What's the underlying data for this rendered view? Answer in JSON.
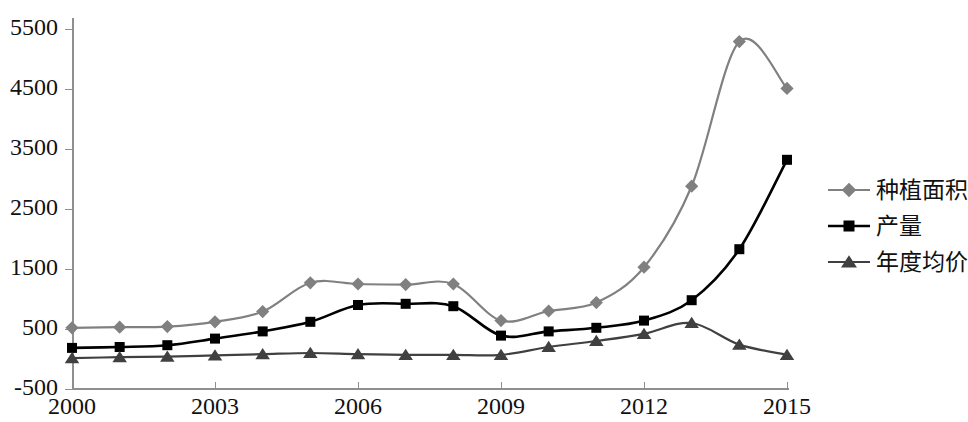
{
  "chart_data": {
    "type": "line",
    "title": "",
    "xlabel": "",
    "ylabel": "",
    "x": [
      2000,
      2001,
      2002,
      2003,
      2004,
      2005,
      2006,
      2007,
      2008,
      2009,
      2010,
      2011,
      2012,
      2013,
      2014,
      2015
    ],
    "xlim": [
      2000,
      2015
    ],
    "ylim": [
      -500,
      6000
    ],
    "yticks": [
      -500,
      500,
      1500,
      2500,
      3500,
      4500,
      5500
    ],
    "ytick_labels": [
      "-500",
      "500",
      "1500",
      "2500",
      "3500",
      "4500",
      "5500"
    ],
    "xticks": [
      2000,
      2003,
      2006,
      2009,
      2012,
      2015
    ],
    "xtick_labels": [
      "2000",
      "2003",
      "2006",
      "2009",
      "2012",
      "2015"
    ],
    "grid": false,
    "legend_position": "right",
    "series": [
      {
        "name": "种植面积",
        "marker": "diamond",
        "color": "#808080",
        "values": [
          520,
          530,
          540,
          620,
          790,
          1270,
          1250,
          1240,
          1250,
          640,
          800,
          940,
          1530,
          2880,
          5290,
          4510
        ]
      },
      {
        "name": "产量",
        "marker": "square",
        "color": "#000000",
        "values": [
          185,
          200,
          230,
          340,
          460,
          620,
          900,
          920,
          880,
          390,
          460,
          520,
          640,
          980,
          1830,
          3320
        ]
      },
      {
        "name": "年度均价",
        "marker": "triangle",
        "color": "#404040",
        "values": [
          15,
          30,
          40,
          60,
          80,
          100,
          80,
          70,
          70,
          70,
          200,
          300,
          420,
          600,
          240,
          70
        ]
      }
    ]
  },
  "axis": {
    "axis_color": "#8f8f8f",
    "tick_label_color": "#111111"
  },
  "legend": {
    "items": [
      {
        "label": "种植面积",
        "marker": "diamond",
        "color": "#808080"
      },
      {
        "label": "产量",
        "marker": "square",
        "color": "#000000"
      },
      {
        "label": "年度均价",
        "marker": "triangle",
        "color": "#404040"
      }
    ]
  }
}
